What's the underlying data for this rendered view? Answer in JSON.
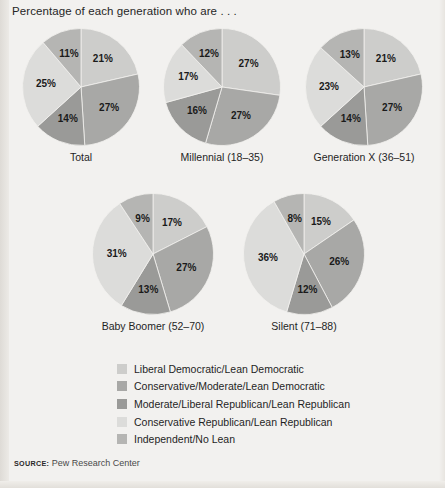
{
  "title": "Percentage of each generation who are . . .",
  "source": {
    "label": "SOURCE:",
    "value": "Pew Research Center"
  },
  "colors": {
    "background": "#f2f1ef",
    "slice_liberal_democratic": "#cdcdcb",
    "slice_conservative_moderate_democratic": "#a8a8a6",
    "slice_moderate_liberal_republican": "#9a9a98",
    "slice_conservative_republican": "#dcdcda",
    "slice_independent_no_lean": "#b5b5b3"
  },
  "legend": {
    "items": [
      {
        "label": "Liberal Democratic/Lean Democratic",
        "color": "#cdcdcb"
      },
      {
        "label": "Conservative/Moderate/Lean Democratic",
        "color": "#a8a8a6"
      },
      {
        "label": "Moderate/Liberal Republican/Lean Republican",
        "color": "#9a9a98"
      },
      {
        "label": "Conservative Republican/Lean Republican",
        "color": "#dcdcda"
      },
      {
        "label": "Independent/No Lean",
        "color": "#b5b5b3"
      }
    ]
  },
  "chart_data": {
    "type": "pie",
    "title": "Percentage of each generation who are . . .",
    "xlabel": "",
    "ylabel": "",
    "legend_position": "bottom",
    "categories": [
      "Liberal Democratic/Lean Democratic",
      "Conservative/Moderate/Lean Democratic",
      "Moderate/Liberal Republican/Lean Republican",
      "Conservative Republican/Lean Republican",
      "Independent/No Lean"
    ],
    "units": "percent",
    "charts": [
      {
        "name": "Total",
        "caption": "Total",
        "values": [
          21,
          27,
          14,
          25,
          11
        ],
        "labels": [
          "21%",
          "27%",
          "14%",
          "25%",
          "11%"
        ]
      },
      {
        "name": "Millennial",
        "caption": "Millennial (18–35)",
        "values": [
          27,
          27,
          16,
          17,
          12
        ],
        "labels": [
          "27%",
          "27%",
          "16%",
          "17%",
          "12%"
        ]
      },
      {
        "name": "Generation X",
        "caption": "Generation X (36–51)",
        "values": [
          21,
          27,
          14,
          23,
          13
        ],
        "labels": [
          "21%",
          "27%",
          "14%",
          "23%",
          "13%"
        ]
      },
      {
        "name": "Baby Boomer",
        "caption": "Baby Boomer (52–70)",
        "values": [
          17,
          27,
          13,
          31,
          9
        ],
        "labels": [
          "17%",
          "27%",
          "13%",
          "31%",
          "9%"
        ]
      },
      {
        "name": "Silent",
        "caption": "Silent (71–88)",
        "values": [
          15,
          26,
          12,
          36,
          8
        ],
        "labels": [
          "15%",
          "26%",
          "12%",
          "36%",
          "8%"
        ]
      }
    ]
  },
  "layout": {
    "charts": [
      {
        "left": 22,
        "top": 28,
        "size": 118,
        "label_radius": 0.6
      },
      {
        "left": 163,
        "top": 28,
        "size": 118,
        "label_radius": 0.6
      },
      {
        "left": 305,
        "top": 28,
        "size": 118,
        "label_radius": 0.6
      },
      {
        "left": 92,
        "top": 193,
        "size": 122,
        "label_radius": 0.6
      },
      {
        "left": 243,
        "top": 193,
        "size": 122,
        "label_radius": 0.6
      }
    ]
  }
}
